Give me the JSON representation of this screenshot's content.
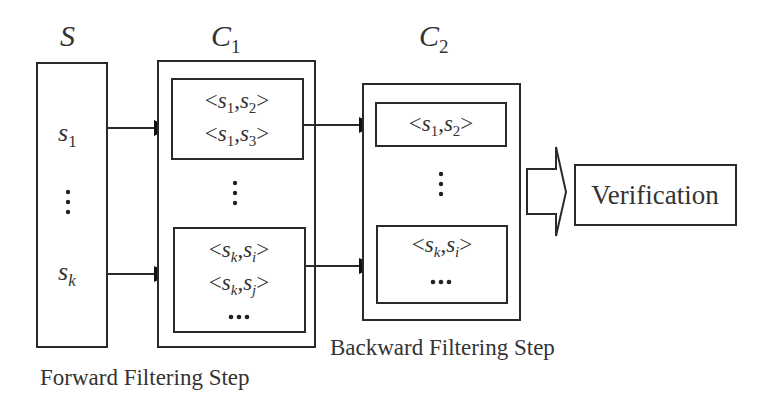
{
  "diagram": {
    "colors": {
      "stroke": "#2a2a2a",
      "text": "#333333",
      "background": "#ffffff"
    },
    "sets": {
      "S": {
        "label": "S",
        "elements": [
          {
            "base": "s",
            "sub": "1"
          },
          {
            "ellipsis": "vertical"
          },
          {
            "base": "s",
            "sub": "k"
          }
        ]
      },
      "C1": {
        "label": "C",
        "label_sub": "1",
        "groups": [
          {
            "pairs": [
              {
                "a": "s",
                "a_sub": "1",
                "b": "s",
                "b_sub": "2"
              },
              {
                "a": "s",
                "a_sub": "1",
                "b": "s",
                "b_sub": "3"
              }
            ]
          },
          {
            "ellipsis": "vertical"
          },
          {
            "pairs": [
              {
                "a": "s",
                "a_sub": "k",
                "b": "s",
                "b_sub": "i"
              },
              {
                "a": "s",
                "a_sub": "k",
                "b": "s",
                "b_sub": "j"
              }
            ],
            "more": "•••"
          }
        ]
      },
      "C2": {
        "label": "C",
        "label_sub": "2",
        "groups": [
          {
            "pairs": [
              {
                "a": "s",
                "a_sub": "1",
                "b": "s",
                "b_sub": "2"
              }
            ]
          },
          {
            "ellipsis": "vertical"
          },
          {
            "pairs": [
              {
                "a": "s",
                "a_sub": "k",
                "b": "s",
                "b_sub": "i"
              }
            ],
            "more": "•••"
          }
        ]
      }
    },
    "steps": {
      "forward": "Forward Filtering Step",
      "backward": "Backward Filtering Step",
      "verification": "Verification"
    },
    "edges": [
      {
        "from": "S.s1",
        "to": "C1.group1"
      },
      {
        "from": "S.sk",
        "to": "C1.group2"
      },
      {
        "from": "C1.group1",
        "to": "C2.group1"
      },
      {
        "from": "C1.group2",
        "to": "C2.group2"
      },
      {
        "from": "C2",
        "to": "Verification",
        "style": "block-arrow"
      }
    ],
    "glyphs": {
      "lt": "<",
      "gt": ">",
      "comma": ","
    }
  }
}
